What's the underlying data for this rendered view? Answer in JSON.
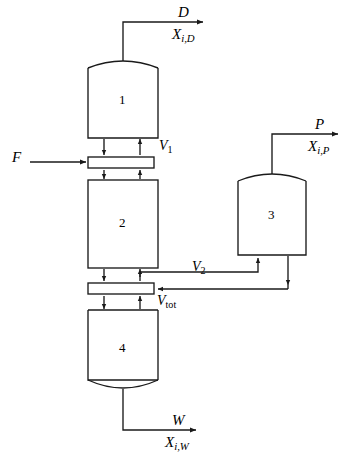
{
  "diagram": {
    "type": "process-flow-diagram",
    "background_color": "#ffffff",
    "line_color": "#1a1a1a",
    "vessels": [
      {
        "id": "v1",
        "label": "1",
        "shape": "domed-top-rectangle",
        "x": 88,
        "y": 60,
        "width": 70,
        "height": 78
      },
      {
        "id": "v2",
        "label": "2",
        "shape": "rectangle",
        "x": 88,
        "y": 180,
        "width": 70,
        "height": 88
      },
      {
        "id": "v3",
        "label": "3",
        "shape": "domed-top-rectangle",
        "x": 238,
        "y": 173,
        "width": 68,
        "height": 82
      },
      {
        "id": "v4",
        "label": "4",
        "shape": "domed-bottom-rectangle",
        "x": 88,
        "y": 310,
        "width": 70,
        "height": 80
      }
    ],
    "trays": [
      {
        "id": "tray1",
        "label": "V1",
        "x": 88,
        "y": 157,
        "width": 66,
        "height": 11
      },
      {
        "id": "tray2",
        "label": "Vtot",
        "x": 88,
        "y": 283,
        "width": 66,
        "height": 11
      }
    ],
    "streams": [
      {
        "id": "feed",
        "name": "F",
        "composition": null,
        "direction": "inlet",
        "target": "tray1"
      },
      {
        "id": "distillate",
        "name": "D",
        "composition": "Xi,D",
        "direction": "outlet",
        "source": "v1"
      },
      {
        "id": "product",
        "name": "P",
        "composition": "Xi,P",
        "direction": "outlet",
        "source": "v3"
      },
      {
        "id": "bottoms",
        "name": "W",
        "composition": "Xi,W",
        "direction": "outlet",
        "source": "v4"
      }
    ],
    "vapor_labels": [
      {
        "id": "V1",
        "base": "V",
        "sub": "1",
        "sub_style": "normal"
      },
      {
        "id": "V2",
        "base": "V",
        "sub": "2",
        "sub_style": "normal"
      },
      {
        "id": "Vtot",
        "base": "V",
        "sub": "tot",
        "sub_style": "normal"
      }
    ],
    "labels": {
      "stream_D": "D",
      "comp_D_base": "X",
      "comp_D_sub": "i,D",
      "stream_P": "P",
      "comp_P_base": "X",
      "comp_P_sub": "i,P",
      "stream_W": "W",
      "comp_W_base": "X",
      "comp_W_sub": "i,W",
      "stream_F": "F",
      "vessel_1": "1",
      "vessel_2": "2",
      "vessel_3": "3",
      "vessel_4": "4",
      "vap_V_base": "V",
      "vap_1_sub": "1",
      "vap_2_sub": "2",
      "vap_tot_sub": "tot"
    }
  }
}
